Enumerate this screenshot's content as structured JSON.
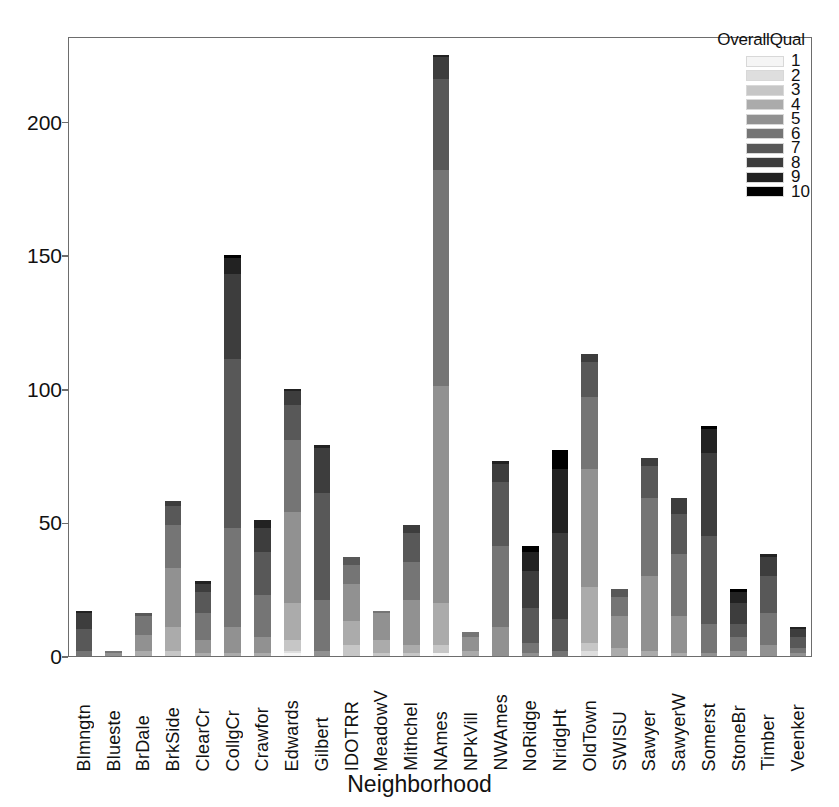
{
  "chart_data": {
    "type": "bar",
    "stacked": true,
    "title": "",
    "xlabel": "Neighborhood",
    "ylabel": "",
    "ylim": [
      0,
      232
    ],
    "yticks": [
      0,
      50,
      100,
      150,
      200
    ],
    "grid": false,
    "legend": {
      "title": "OverallQual",
      "position": "top-right",
      "entries": [
        {
          "label": "1",
          "color": "#f5f5f5"
        },
        {
          "label": "2",
          "color": "#dedede"
        },
        {
          "label": "3",
          "color": "#c6c6c6"
        },
        {
          "label": "4",
          "color": "#ababab"
        },
        {
          "label": "5",
          "color": "#919191"
        },
        {
          "label": "6",
          "color": "#757575"
        },
        {
          "label": "7",
          "color": "#585858"
        },
        {
          "label": "8",
          "color": "#3d3d3d"
        },
        {
          "label": "9",
          "color": "#222222"
        },
        {
          "label": "10",
          "color": "#000000"
        }
      ]
    },
    "categories": [
      "Blmngtn",
      "Blueste",
      "BrDale",
      "BrkSide",
      "ClearCr",
      "CollgCr",
      "Crawfor",
      "Edwards",
      "Gilbert",
      "IDOTRR",
      "MeadowV",
      "Mithchel",
      "NAmes",
      "NPkVill",
      "NWAmes",
      "NoRidge",
      "NridgHt",
      "OldTown",
      "SWISU",
      "Sawyer",
      "SawyerW",
      "Somerst",
      "StoneBr",
      "Timber",
      "Veenker"
    ],
    "totals": [
      17,
      2,
      16,
      58,
      28,
      150,
      51,
      100,
      79,
      37,
      17,
      49,
      225,
      9,
      73,
      41,
      77,
      113,
      25,
      74,
      59,
      86,
      25,
      38,
      11
    ],
    "series": [
      {
        "name": "1",
        "values": [
          0,
          0,
          0,
          0,
          0,
          0,
          0,
          1,
          0,
          0,
          0,
          0,
          1,
          0,
          0,
          0,
          0,
          0,
          0,
          0,
          0,
          0,
          0,
          0,
          0
        ]
      },
      {
        "name": "2",
        "values": [
          0,
          0,
          0,
          0,
          0,
          0,
          0,
          1,
          0,
          0,
          0,
          0,
          0,
          0,
          0,
          0,
          0,
          2,
          0,
          0,
          0,
          0,
          0,
          0,
          0
        ]
      },
      {
        "name": "3",
        "values": [
          0,
          0,
          0,
          2,
          0,
          0,
          0,
          4,
          0,
          4,
          1,
          1,
          3,
          0,
          0,
          0,
          0,
          3,
          0,
          0,
          0,
          0,
          0,
          0,
          0
        ]
      },
      {
        "name": "4",
        "values": [
          0,
          0,
          2,
          9,
          1,
          1,
          1,
          14,
          0,
          9,
          5,
          3,
          16,
          2,
          0,
          0,
          0,
          21,
          3,
          2,
          1,
          0,
          0,
          0,
          0
        ]
      },
      {
        "name": "5",
        "values": [
          0,
          1,
          6,
          22,
          5,
          10,
          6,
          34,
          2,
          14,
          10,
          17,
          81,
          5,
          11,
          1,
          0,
          44,
          12,
          28,
          14,
          1,
          2,
          4,
          1
        ]
      },
      {
        "name": "6",
        "values": [
          2,
          1,
          7,
          16,
          10,
          37,
          16,
          27,
          19,
          7,
          1,
          14,
          81,
          2,
          30,
          4,
          2,
          27,
          7,
          29,
          23,
          11,
          5,
          12,
          2
        ]
      },
      {
        "name": "7",
        "values": [
          8,
          0,
          1,
          7,
          8,
          63,
          16,
          13,
          40,
          3,
          0,
          11,
          34,
          0,
          24,
          13,
          12,
          13,
          3,
          12,
          15,
          33,
          5,
          14,
          4
        ]
      },
      {
        "name": "8",
        "values": [
          6,
          0,
          0,
          2,
          3,
          32,
          9,
          5,
          17,
          0,
          0,
          3,
          8,
          0,
          7,
          14,
          32,
          3,
          0,
          3,
          6,
          31,
          8,
          7,
          3
        ]
      },
      {
        "name": "9",
        "values": [
          1,
          0,
          0,
          0,
          1,
          6,
          3,
          1,
          1,
          0,
          0,
          0,
          1,
          0,
          1,
          7,
          24,
          0,
          0,
          0,
          0,
          9,
          4,
          1,
          1
        ]
      },
      {
        "name": "10",
        "values": [
          0,
          0,
          0,
          0,
          0,
          1,
          0,
          0,
          0,
          0,
          0,
          0,
          0,
          0,
          0,
          2,
          7,
          0,
          0,
          0,
          0,
          1,
          1,
          0,
          0
        ]
      }
    ]
  }
}
